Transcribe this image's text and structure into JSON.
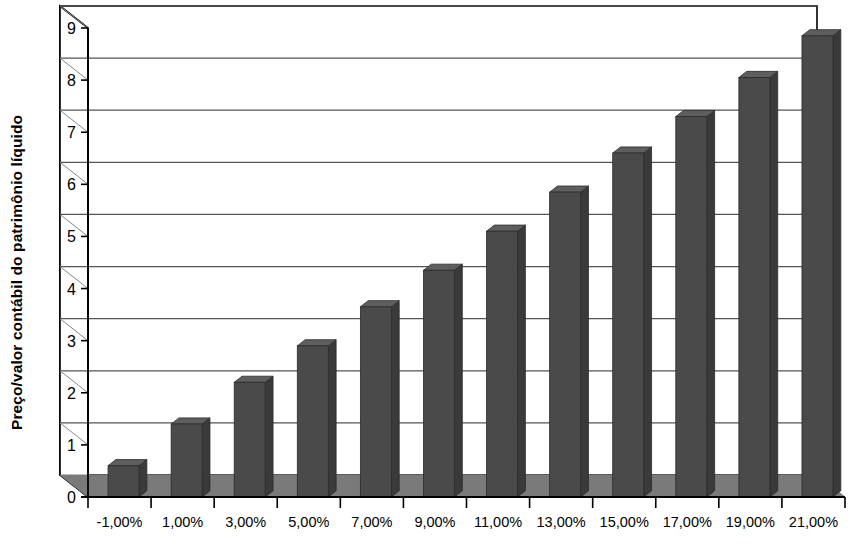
{
  "chart_data": {
    "type": "bar",
    "title": "",
    "subtitle": "",
    "xlabel": "",
    "ylabel": "Preço/valor contábil do patrimônio líquido",
    "categories": [
      "-1,00%",
      "1,00%",
      "3,00%",
      "5,00%",
      "7,00%",
      "9,00%",
      "11,00%",
      "13,00%",
      "15,00%",
      "17,00%",
      "19,00%",
      "21,00%"
    ],
    "values": [
      0.6,
      1.4,
      2.2,
      2.9,
      3.65,
      4.35,
      5.1,
      5.85,
      6.6,
      7.3,
      8.05,
      8.85
    ],
    "ylim": [
      0,
      9
    ],
    "ytick_labels": [
      "0",
      "1",
      "2",
      "3",
      "4",
      "5",
      "6",
      "7",
      "8",
      "9"
    ],
    "ytick_values": [
      0,
      1,
      2,
      3,
      4,
      5,
      6,
      7,
      8,
      9
    ],
    "grid": true,
    "grid_axis": "y",
    "legend": false,
    "legend_position": "none",
    "style": "3d-column",
    "series": [
      {
        "name": "Preço/valor contábil do patrimônio líquido",
        "values": [
          0.6,
          1.4,
          2.2,
          2.9,
          3.65,
          4.35,
          5.1,
          5.85,
          6.6,
          7.3,
          8.05,
          8.85
        ]
      }
    ],
    "colors": {
      "bar_front": "#4a4a4a",
      "bar_side": "#3a3a3a",
      "bar_top": "#5e5e5e",
      "floor": "#7a7a7a",
      "wall": "#ffffff",
      "axis": "#000000",
      "gridline": "#555555"
    }
  }
}
